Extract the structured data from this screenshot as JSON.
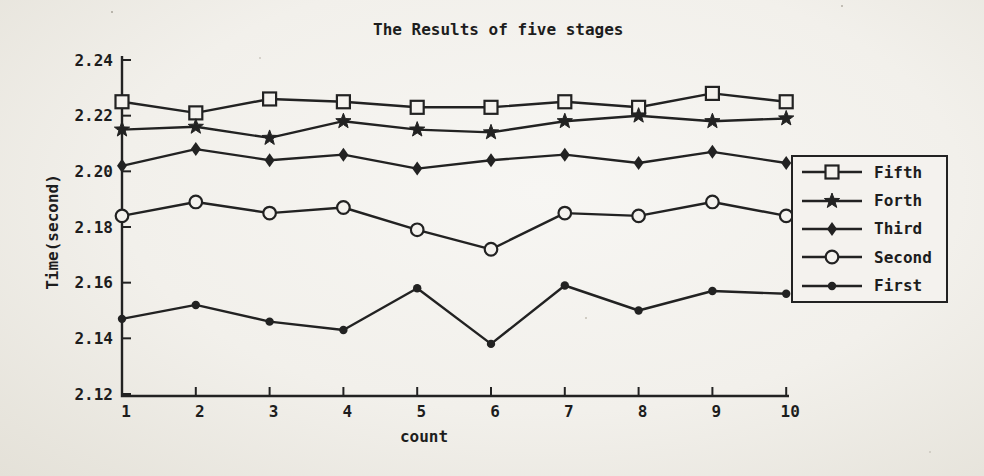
{
  "colors": {
    "paper": "#f4f2ee",
    "ink": "#222222"
  },
  "chart_data": {
    "type": "line",
    "title": "The Results of five stages",
    "xlabel": "count",
    "ylabel": "Time(second)",
    "x": [
      1,
      2,
      3,
      4,
      5,
      6,
      7,
      8,
      9,
      10
    ],
    "x_tick_labels": [
      "1",
      "2",
      "3",
      "4",
      "5",
      "6",
      "7",
      "8",
      "9",
      "10"
    ],
    "xlim": [
      1,
      10
    ],
    "ylim": [
      2.12,
      2.24
    ],
    "y_tick_values": [
      2.12,
      2.14,
      2.16,
      2.18,
      2.2,
      2.22,
      2.24
    ],
    "y_tick_labels": [
      "2.12",
      "2.14",
      "2.16",
      "2.18",
      "2.20",
      "2.22",
      "2.24"
    ],
    "grid": false,
    "legend_position": "right",
    "series": [
      {
        "name": "Fifth",
        "marker": "square-open",
        "values": [
          2.225,
          2.221,
          2.226,
          2.225,
          2.223,
          2.223,
          2.225,
          2.223,
          2.228,
          2.225
        ]
      },
      {
        "name": "Forth",
        "marker": "star-filled",
        "values": [
          2.215,
          2.216,
          2.212,
          2.218,
          2.215,
          2.214,
          2.218,
          2.22,
          2.218,
          2.219
        ]
      },
      {
        "name": "Third",
        "marker": "diamond-filled",
        "values": [
          2.202,
          2.208,
          2.204,
          2.206,
          2.201,
          2.204,
          2.206,
          2.203,
          2.207,
          2.203
        ]
      },
      {
        "name": "Second",
        "marker": "circle-open",
        "values": [
          2.184,
          2.189,
          2.185,
          2.187,
          2.179,
          2.172,
          2.185,
          2.184,
          2.189,
          2.184
        ]
      },
      {
        "name": "First",
        "marker": "dot-filled",
        "values": [
          2.147,
          2.152,
          2.146,
          2.143,
          2.158,
          2.138,
          2.159,
          2.15,
          2.157,
          2.156
        ]
      }
    ]
  }
}
